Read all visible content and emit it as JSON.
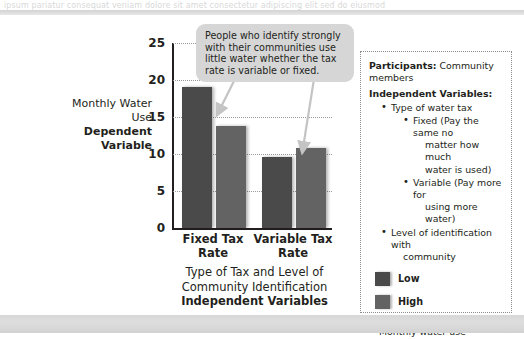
{
  "page": {
    "top_cut_text": "ipsum pariatur consequat veniam dolore sit amet consectetur adipiscing elit sed do eiusmod",
    "background_color": "#ffffff",
    "strip_color": "#d7d7d7"
  },
  "callout": {
    "text": "People who identify strongly with their communities use little water whether the tax rate is variable or fixed.",
    "background_color": "#d6d6d6"
  },
  "axis_titles": {
    "y_regular": "Monthly Water Use",
    "y_bold": "Dependent Variable",
    "x_regular_line1": "Type of Tax and Level of",
    "x_regular_line2": "Community Identification",
    "x_bold": "Independent Variables"
  },
  "notes": {
    "participants_label": "Participants:",
    "participants_value": "Community members",
    "iv_heading": "Independent Variables:",
    "iv_items": [
      {
        "label": "Type of water tax",
        "children": [
          {
            "label": "Fixed (Pay the same no",
            "continuation": [
              "matter how much",
              "water is used)"
            ]
          },
          {
            "label": "Variable (Pay more for",
            "continuation": [
              "using more water)"
            ]
          }
        ]
      },
      {
        "label": "Level of identification with",
        "continuation": [
          "community"
        ],
        "children": []
      }
    ],
    "legend": [
      {
        "name": "Low",
        "color": "#4a4a4a"
      },
      {
        "name": "High",
        "color": "#636363"
      }
    ],
    "dv_heading": "Dependent Variable:",
    "dv_value": "Monthly water use"
  },
  "chart_data": {
    "type": "bar",
    "title": "",
    "xlabel": "Type of Tax and Level of Community Identification (Independent Variables)",
    "ylabel": "Monthly Water Use (Dependent Variable)",
    "categories": [
      "Fixed Tax Rate",
      "Variable Tax Rate"
    ],
    "series": [
      {
        "name": "Low",
        "color": "#4a4a4a",
        "values": [
          19.0,
          9.6
        ]
      },
      {
        "name": "High",
        "color": "#636363",
        "values": [
          13.8,
          10.8
        ]
      }
    ],
    "ylim": [
      0,
      25
    ],
    "yticks": [
      0,
      5,
      10,
      15,
      20,
      25
    ],
    "ytick_labels": [
      "0",
      "5",
      "10",
      "15",
      "20",
      "25"
    ],
    "grid": "horizontal-dotted",
    "legend_position": "right-panel"
  }
}
